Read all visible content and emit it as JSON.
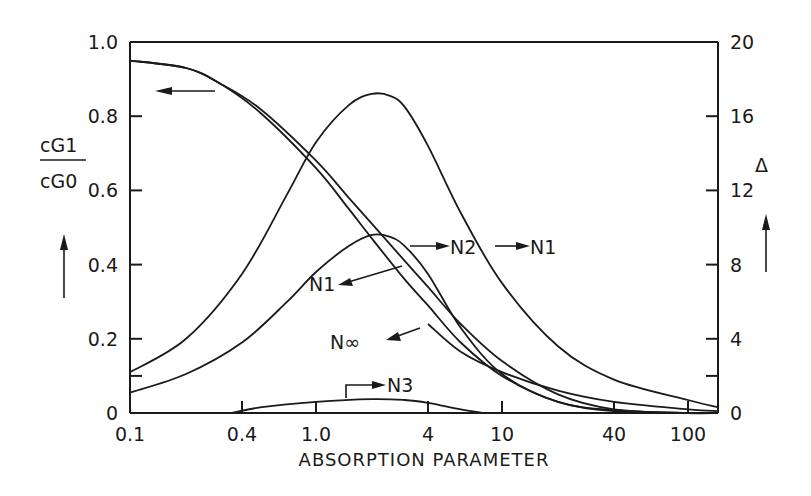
{
  "chart_data": {
    "type": "line",
    "title": "",
    "xlabel": "ABSORPTION PARAMETER",
    "xscale": "log",
    "xlim": [
      0.1,
      180
    ],
    "x_ticks": [
      "0.1",
      "0.4",
      "1.0",
      "4",
      "10",
      "40",
      "100"
    ],
    "x_tick_values": [
      0.1,
      0.4,
      1.0,
      4,
      10,
      40,
      100
    ],
    "ylabel_left": "cG1 / cG0",
    "ylabel_left_num": "cG1",
    "ylabel_left_den": "cG0",
    "ylim_left": [
      0,
      1.0
    ],
    "y_ticks_left": [
      "0",
      "0.2",
      "0.4",
      "0.6",
      "0.8",
      "1.0"
    ],
    "ylabel_right": "Δ",
    "ylim_right": [
      0,
      20
    ],
    "y_ticks_right": [
      "0",
      "4",
      "8",
      "12",
      "16",
      "20"
    ],
    "grid": false,
    "annotations": [
      "N1",
      "N2",
      "N1",
      "N∞",
      "N3"
    ],
    "series": [
      {
        "name": "cG1/cG0 N1",
        "axis": "left",
        "x": [
          0.1,
          0.2,
          0.3,
          0.5,
          1.0,
          1.5,
          2.0,
          3.0,
          4.0,
          6.0,
          10,
          20,
          40,
          100,
          180
        ],
        "values": [
          0.95,
          0.93,
          0.89,
          0.82,
          0.68,
          0.58,
          0.51,
          0.41,
          0.34,
          0.24,
          0.14,
          0.05,
          0.01,
          0.0,
          0.0
        ]
      },
      {
        "name": "cG1/cG0 N∞",
        "axis": "left",
        "x": [
          0.1,
          0.2,
          0.3,
          0.5,
          1.0,
          1.5,
          2.0,
          3.0,
          4.0,
          6.0,
          10,
          20,
          40,
          100,
          180
        ],
        "values": [
          0.95,
          0.93,
          0.89,
          0.81,
          0.66,
          0.55,
          0.47,
          0.36,
          0.29,
          0.19,
          0.1,
          0.03,
          0.005,
          0.0,
          0.0
        ]
      },
      {
        "name": "Δ N1",
        "axis": "right",
        "x": [
          0.1,
          0.2,
          0.4,
          0.7,
          1.0,
          1.5,
          2.0,
          2.5,
          3.0,
          4.0,
          6.0,
          10,
          20,
          40,
          100,
          180
        ],
        "values": [
          2.2,
          4.0,
          7.5,
          11.8,
          14.6,
          16.6,
          17.2,
          17.1,
          16.5,
          14.4,
          10.8,
          7.0,
          3.6,
          1.8,
          0.7,
          0.3
        ]
      },
      {
        "name": "Δ N2",
        "axis": "right",
        "x": [
          0.1,
          0.2,
          0.4,
          0.7,
          1.0,
          1.5,
          2.0,
          2.5,
          3.0,
          4.0,
          6.0,
          10,
          20,
          40,
          100,
          180
        ],
        "values": [
          1.1,
          2.1,
          3.8,
          6.0,
          7.6,
          9.0,
          9.6,
          9.5,
          9.0,
          7.5,
          4.6,
          2.1,
          0.6,
          0.15,
          0.0,
          0.0
        ]
      },
      {
        "name": "Δ N3",
        "axis": "right",
        "x": [
          0.35,
          0.5,
          1.0,
          2.0,
          3.0,
          4.0,
          6.0,
          8.0
        ],
        "values": [
          0.0,
          0.3,
          0.6,
          0.75,
          0.7,
          0.55,
          0.2,
          0.0
        ]
      },
      {
        "name": "Δ N∞",
        "axis": "right",
        "x": [
          4.0,
          6.0,
          10,
          20,
          40,
          100,
          180
        ],
        "values": [
          4.8,
          3.3,
          2.2,
          1.2,
          0.6,
          0.2,
          0.1
        ]
      }
    ]
  }
}
